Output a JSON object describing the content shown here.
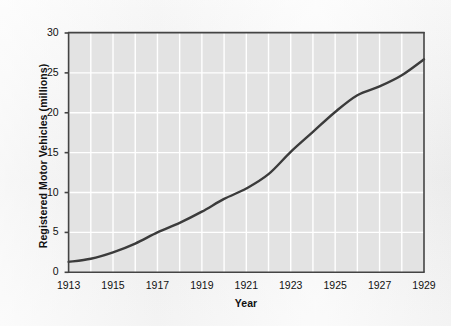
{
  "chart_data": {
    "type": "line",
    "title": "",
    "xlabel": "Year",
    "ylabel": "Registered Motor Vehicles (millions)",
    "xlim": [
      1913,
      1929
    ],
    "ylim": [
      0,
      30
    ],
    "grid": true,
    "legend": "none",
    "x_ticks": [
      "1913",
      "1915",
      "1917",
      "1919",
      "1921",
      "1923",
      "1925",
      "1927",
      "1929"
    ],
    "y_ticks": [
      "0",
      "5",
      "10",
      "15",
      "20",
      "25",
      "30"
    ],
    "x": [
      1913,
      1914,
      1915,
      1916,
      1917,
      1918,
      1919,
      1920,
      1921,
      1922,
      1923,
      1924,
      1925,
      1926,
      1927,
      1928,
      1929
    ],
    "values": [
      1.3,
      1.7,
      2.5,
      3.6,
      5.0,
      6.2,
      7.6,
      9.2,
      10.5,
      12.3,
      15.1,
      17.6,
      20.1,
      22.2,
      23.3,
      24.7,
      26.7
    ],
    "series": [
      {
        "name": "Registered Motor Vehicles",
        "values": [
          1.3,
          1.7,
          2.5,
          3.6,
          5.0,
          6.2,
          7.6,
          9.2,
          10.5,
          12.3,
          15.1,
          17.6,
          20.1,
          22.2,
          23.3,
          24.7,
          26.7
        ]
      }
    ],
    "colors": {
      "line": "#3b3b3b",
      "plot_background": "#e3e3e3",
      "gridline": "#ffffff",
      "axis": "#444444",
      "figure_background": "#f2f2f2",
      "text": "#111111"
    }
  }
}
